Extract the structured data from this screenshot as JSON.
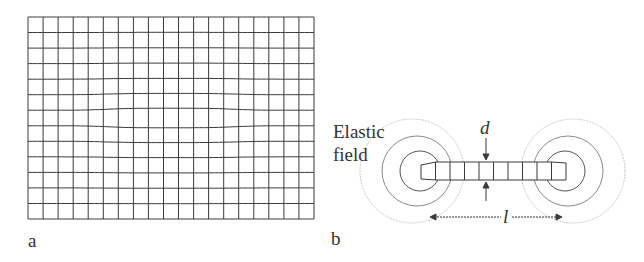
{
  "panels": {
    "a": {
      "label": "a",
      "grid": {
        "columns": 19,
        "rows": 13,
        "x0": 28,
        "y0": 17,
        "x1": 314,
        "y1": 219,
        "line_color": "#3a3a3a"
      }
    },
    "b": {
      "label": "b",
      "field_label_line1": "Elastic",
      "field_label_line2": "field",
      "thickness_symbol": "d",
      "length_symbol": "l",
      "strip_cells": 10,
      "circle_color": "#9a9a9a"
    }
  }
}
